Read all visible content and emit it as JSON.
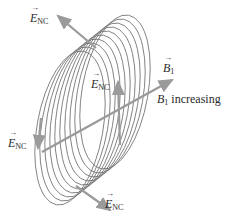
{
  "diagram": {
    "labels": {
      "e_top_symbol": "E",
      "e_top_sub": "NC",
      "e_mid_symbol": "E",
      "e_mid_sub": "NC",
      "e_left_symbol": "E",
      "e_left_sub": "NC",
      "e_bottom_symbol": "E",
      "e_bottom_sub": "NC",
      "b_symbol": "B",
      "b_sub": "1",
      "b_caption_symbol": "B",
      "b_caption_sub": "1",
      "b_caption_text": " increasing"
    },
    "colors": {
      "coil": "#6e6e6e",
      "arrow": "#9a9a9a",
      "text": "#2a2a2a"
    },
    "coil_turns": 10
  }
}
